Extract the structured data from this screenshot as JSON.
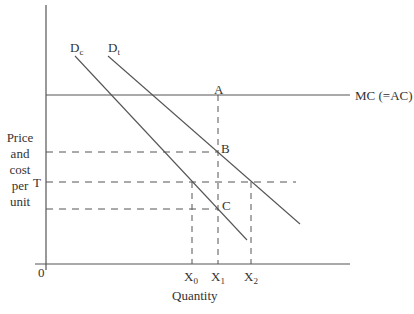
{
  "diagram": {
    "type": "economics-demand-cost",
    "y_axis_label_lines": [
      "Price",
      "and",
      "cost",
      "per",
      "unit"
    ],
    "x_axis_label": "Quantity",
    "origin_label": "0",
    "price_label_T": "T",
    "mc_label": "MC (=AC)",
    "curves": [
      {
        "name": "D",
        "subscript": "c",
        "from": [
          75,
          56
        ],
        "to": [
          247,
          240
        ]
      },
      {
        "name": "D",
        "subscript": "t",
        "from": [
          108,
          56
        ],
        "to": [
          300,
          224
        ]
      }
    ],
    "points": {
      "A": "A",
      "B": "B",
      "C": "C"
    },
    "x_ticks": [
      {
        "base": "X",
        "sub": "0",
        "x": 192
      },
      {
        "base": "X",
        "sub": "1",
        "x": 218
      },
      {
        "base": "X",
        "sub": "2",
        "x": 251
      }
    ],
    "colors": {
      "line": "#555555",
      "text": "#333333",
      "background": "#ffffff"
    }
  }
}
